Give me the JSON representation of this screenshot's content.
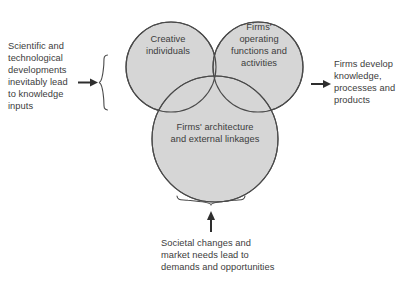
{
  "figure": {
    "background_color": "#ffffff",
    "circle_fill_color": "#d6d6d6",
    "circle_stroke_color": "#4a4a4a",
    "text_color": "#3c3c3c"
  },
  "circles": [
    {
      "id": "creative-individuals",
      "label": "Creative\nindividuals",
      "position": "top-left"
    },
    {
      "id": "firms-operating-functions",
      "label": "Firms'\noperating\nfunctions and\nactivities",
      "position": "top-right"
    },
    {
      "id": "firms-architecture-linkages",
      "label": "Firms' architecture\nand external linkages",
      "position": "bottom-center"
    }
  ],
  "annotations": {
    "input_left": {
      "text": "Scientific and\ntechnological\ndevelopments\ninevitably lead\nto knowledge\ninputs",
      "arrow": "arrow-right",
      "brace": "brace-left"
    },
    "output_right": {
      "text": "Firms develop\nknowledge,\nprocesses and\nproducts",
      "arrow": "arrow-right"
    },
    "input_bottom": {
      "text": "Societal changes and\nmarket needs lead to\ndemands and opportunities",
      "arrow": "arrow-up",
      "brace": "brace-bottom"
    }
  }
}
